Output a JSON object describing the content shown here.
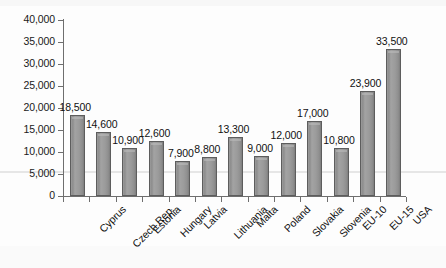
{
  "chart_data": {
    "type": "bar",
    "title": "",
    "subtitle": "",
    "xlabel": "",
    "ylabel": "",
    "ylim": [
      0,
      40000
    ],
    "grid": false,
    "legend": "none",
    "categories": [
      "Cyprus",
      "Czech Rep.",
      "Estonia",
      "Hungary",
      "Latvia",
      "Lithuania",
      "Malta",
      "Poland",
      "Slovakia",
      "Slovenia",
      "EU-10",
      "EU-15",
      "USA"
    ],
    "values": [
      18500,
      14600,
      10900,
      12600,
      7900,
      8800,
      13300,
      9000,
      12000,
      17000,
      10800,
      23900,
      33500
    ],
    "data_labels": [
      "18,500",
      "14,600",
      "10,900",
      "12,600",
      "7,900",
      "8,800",
      "13,300",
      "9,000",
      "12,000",
      "17,000",
      "10,800",
      "23,900",
      "33,500"
    ],
    "ytick_values": [
      0,
      5000,
      10000,
      15000,
      20000,
      25000,
      30000,
      35000,
      40000
    ],
    "ytick_labels": [
      "0",
      "5,000",
      "10,000",
      "15,000",
      "20,000",
      "25,000",
      "30,000",
      "35,000",
      "40,000"
    ],
    "series": [
      {
        "name": "",
        "values": [
          18500,
          14600,
          10900,
          12600,
          7900,
          8800,
          13300,
          9000,
          12000,
          17000,
          10800,
          23900,
          33500
        ]
      }
    ],
    "colors": {
      "bar_fill": "#9a9a9a",
      "bar_border": "#5d5d5d",
      "axis": "#6e6e6e",
      "text": "#111111",
      "background": "#fdfdfd"
    }
  }
}
